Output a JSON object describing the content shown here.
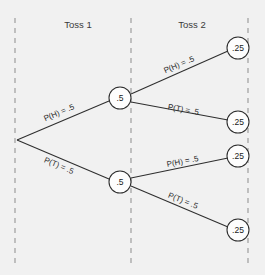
{
  "figure": {
    "background_color": "#f1f1f1",
    "line_color": "#2e2e2e",
    "divider_color": "#9a9a9a",
    "node_fill": "#fdfdfd"
  },
  "stages": [
    {
      "label": "Toss 1",
      "x": 78,
      "y": 28
    },
    {
      "label": "Toss 2",
      "x": 192,
      "y": 28
    }
  ],
  "dividers": [
    {
      "x": 15,
      "y1": 18,
      "y2": 265
    },
    {
      "x": 131,
      "y1": 18,
      "y2": 265
    },
    {
      "x": 248,
      "y1": 18,
      "y2": 265
    }
  ],
  "nodes": {
    "root": {
      "x": 17,
      "y": 140,
      "r": 0,
      "label": ""
    },
    "stage1": [
      {
        "id": "h",
        "x": 120,
        "y": 98,
        "r": 11,
        "label": ".5"
      },
      {
        "id": "t",
        "x": 120,
        "y": 182,
        "r": 11,
        "label": ".5"
      }
    ],
    "stage2": [
      {
        "id": "hh",
        "x": 238,
        "y": 48,
        "r": 11,
        "label": ".25"
      },
      {
        "id": "ht",
        "x": 238,
        "y": 122,
        "r": 11,
        "label": ".25"
      },
      {
        "id": "th",
        "x": 238,
        "y": 156,
        "r": 11,
        "label": ".25"
      },
      {
        "id": "tt",
        "x": 238,
        "y": 230,
        "r": 11,
        "label": ".25"
      }
    ]
  },
  "edges": [
    {
      "id": "root-h",
      "label": "P(H) = .5",
      "x1": 17,
      "y1": 140,
      "x2": 109,
      "y2": 101,
      "label_x": 60,
      "label_y": 115,
      "angle": -23
    },
    {
      "id": "root-t",
      "label": "P(T) = .5",
      "x1": 17,
      "y1": 140,
      "x2": 109,
      "y2": 179,
      "label_x": 58,
      "label_y": 168,
      "angle": 23
    },
    {
      "id": "h-hh",
      "label": "P(H) = .5",
      "x1": 131,
      "y1": 94,
      "x2": 228,
      "y2": 51,
      "label_x": 180,
      "label_y": 67,
      "angle": -23
    },
    {
      "id": "h-ht",
      "label": "P(T) = .5",
      "x1": 131,
      "y1": 102,
      "x2": 228,
      "y2": 120,
      "label_x": 183,
      "label_y": 112,
      "angle": 10
    },
    {
      "id": "t-th",
      "label": "P(H) = .5",
      "x1": 131,
      "y1": 178,
      "x2": 228,
      "y2": 158,
      "label_x": 183,
      "label_y": 164,
      "angle": -11
    },
    {
      "id": "t-tt",
      "label": "P(T) = .5",
      "x1": 131,
      "y1": 186,
      "x2": 228,
      "y2": 227,
      "label_x": 182,
      "label_y": 203,
      "angle": 22
    }
  ],
  "chart_data": {
    "type": "diagram",
    "stage_labels": [
      "Toss 1",
      "Toss 2"
    ],
    "outcomes": [
      {
        "path": [
          "H",
          "H"
        ],
        "branch_probabilities": [
          0.5,
          0.5
        ],
        "joint_probability": 0.25,
        "displayed": ".25"
      },
      {
        "path": [
          "H",
          "T"
        ],
        "branch_probabilities": [
          0.5,
          0.5
        ],
        "joint_probability": 0.25,
        "displayed": ".25"
      },
      {
        "path": [
          "T",
          "H"
        ],
        "branch_probabilities": [
          0.5,
          0.5
        ],
        "joint_probability": 0.25,
        "displayed": ".25"
      },
      {
        "path": [
          "T",
          "T"
        ],
        "branch_probabilities": [
          0.5,
          0.5
        ],
        "joint_probability": 0.25,
        "displayed": ".25"
      }
    ],
    "stage1_node_values": [
      ".5",
      ".5"
    ],
    "stage2_node_values": [
      ".25",
      ".25",
      ".25",
      ".25"
    ],
    "edge_labels": [
      "P(H) = .5",
      "P(T) = .5",
      "P(H) = .5",
      "P(T) = .5",
      "P(H) = .5",
      "P(T) = .5"
    ]
  }
}
